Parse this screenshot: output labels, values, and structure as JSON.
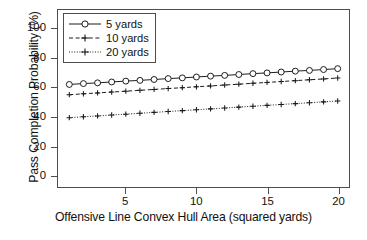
{
  "chart_data": {
    "type": "line",
    "title": "",
    "xlabel": "Offensive Line Convex Hull Area (squared yards)",
    "ylabel": "Pass Completion Probability (%)",
    "xlim": [
      0.2,
      20.8
    ],
    "ylim": [
      -8,
      113
    ],
    "xticks": [
      5,
      10,
      15,
      20
    ],
    "yticks": [
      0,
      20,
      40,
      60,
      80,
      100
    ],
    "xtick_labels": [
      "5",
      "10",
      "15",
      "20"
    ],
    "ytick_labels": [
      "0",
      "20",
      "40",
      "60",
      "80",
      "100"
    ],
    "grid": false,
    "legend_position": "top-left",
    "x": [
      1,
      2,
      3,
      4,
      5,
      6,
      7,
      8,
      9,
      10,
      11,
      12,
      13,
      14,
      15,
      16,
      17,
      18,
      19,
      20
    ],
    "series": [
      {
        "name": "5 yards",
        "linestyle": "solid",
        "marker": "circle",
        "color": "#1a1a1a",
        "values": [
          62.1,
          62.7,
          63.2,
          63.8,
          64.4,
          64.9,
          65.5,
          66.1,
          66.6,
          67.2,
          67.8,
          68.3,
          68.9,
          69.5,
          70.0,
          70.6,
          71.2,
          71.7,
          72.3,
          72.9
        ]
      },
      {
        "name": "10 yards",
        "linestyle": "dashed",
        "marker": "plus",
        "color": "#1a1a1a",
        "values": [
          55.1,
          55.7,
          56.3,
          56.9,
          57.5,
          58.1,
          58.7,
          59.3,
          59.9,
          60.5,
          61.1,
          61.7,
          62.3,
          62.9,
          63.5,
          64.1,
          64.7,
          65.3,
          65.9,
          66.5
        ]
      },
      {
        "name": "20 yards",
        "linestyle": "dotted",
        "marker": "plus",
        "color": "#1a1a1a",
        "values": [
          39.4,
          40.0,
          40.6,
          41.2,
          41.8,
          42.4,
          43.0,
          43.6,
          44.2,
          44.8,
          45.4,
          46.0,
          46.6,
          47.2,
          47.8,
          48.4,
          49.0,
          49.6,
          50.2,
          50.8
        ]
      }
    ]
  },
  "legend": {
    "items": [
      {
        "label": "5 yards"
      },
      {
        "label": "10 yards"
      },
      {
        "label": "20 yards"
      }
    ]
  },
  "footer": {
    "cropped_text": ""
  }
}
